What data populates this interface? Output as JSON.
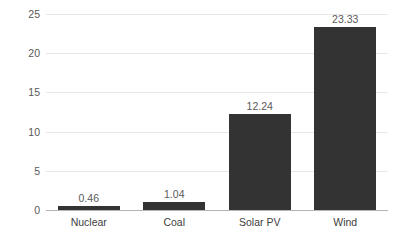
{
  "chart_data": {
    "type": "bar",
    "title": "",
    "subtitle": "",
    "xlabel": "",
    "ylabel": "",
    "categories": [
      "Nuclear",
      "Coal",
      "Solar PV",
      "Wind"
    ],
    "values": [
      0.46,
      1.04,
      12.24,
      23.33
    ],
    "value_labels": [
      "0.46",
      "1.04",
      "12.24",
      "23.33"
    ],
    "ylim": [
      0,
      25
    ],
    "y_ticks": [
      0,
      5,
      10,
      15,
      20,
      25
    ],
    "y_tick_labels": [
      "0",
      "5",
      "10",
      "15",
      "20",
      "25"
    ],
    "grid": "horizontal",
    "legend": "none",
    "bar_color": "#333333",
    "gridline_color": "#e8e8e8",
    "axis_color": "#b4b4b4",
    "label_color": "#595959",
    "category_label_color": "#404040"
  }
}
